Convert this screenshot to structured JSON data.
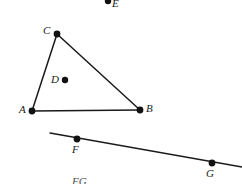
{
  "figure": {
    "type": "geometry-diagram",
    "background_color": "#ffffff",
    "stroke_color": "#1a1a1a",
    "point_color": "#111111",
    "width": 242,
    "height": 184,
    "points": [
      {
        "id": "E",
        "label": "E",
        "x": 108,
        "y": 1,
        "label_x": 112,
        "label_y": -2,
        "dot_radius": 3.2,
        "clipped": true
      },
      {
        "id": "C",
        "label": "C",
        "x": 57,
        "y": 34,
        "label_x": 43,
        "label_y": 25,
        "dot_radius": 3.4,
        "clipped": false
      },
      {
        "id": "D",
        "label": "D",
        "x": 65,
        "y": 80,
        "label_x": 51,
        "label_y": 74,
        "dot_radius": 3.2,
        "clipped": false
      },
      {
        "id": "A",
        "label": "A",
        "x": 32,
        "y": 111,
        "label_x": 19,
        "label_y": 104,
        "dot_radius": 3.4,
        "clipped": false
      },
      {
        "id": "B",
        "label": "B",
        "x": 140,
        "y": 110,
        "label_x": 146,
        "label_y": 103,
        "dot_radius": 3.4,
        "clipped": false
      },
      {
        "id": "F",
        "label": "F",
        "x": 77,
        "y": 139,
        "label_x": 72,
        "label_y": 144,
        "dot_radius": 3.4,
        "clipped": false
      },
      {
        "id": "G",
        "label": "G",
        "x": 212,
        "y": 163,
        "label_x": 206,
        "label_y": 168,
        "dot_radius": 3.4,
        "clipped": false
      }
    ],
    "segments": [
      {
        "id": "AC",
        "from": "A",
        "to": "C",
        "x1": 32,
        "y1": 111,
        "x2": 57,
        "y2": 34,
        "width": 1.5
      },
      {
        "id": "CB",
        "from": "C",
        "to": "B",
        "x1": 57,
        "y1": 34,
        "x2": 140,
        "y2": 110,
        "width": 1.5
      },
      {
        "id": "AB",
        "from": "A",
        "to": "B",
        "x1": 32,
        "y1": 111,
        "x2": 140,
        "y2": 110,
        "width": 1.5
      }
    ],
    "lines": [
      {
        "id": "FG",
        "through": [
          "F",
          "G"
        ],
        "x1": 50,
        "y1": 133,
        "x2": 242,
        "y2": 167,
        "width": 1.3
      }
    ],
    "caption": {
      "prefix": "",
      "math": "FG",
      "suffix": "",
      "visible_fragment": "FG"
    }
  }
}
